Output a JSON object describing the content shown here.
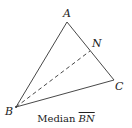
{
  "diagram": {
    "type": "triangle-with-median",
    "vertices": {
      "A": {
        "label": "A",
        "x": 67,
        "y": 22
      },
      "B": {
        "label": "B",
        "x": 16,
        "y": 107
      },
      "C": {
        "label": "C",
        "x": 114,
        "y": 80
      },
      "N": {
        "label": "N",
        "x": 90,
        "y": 51
      }
    },
    "edges": [
      {
        "from": "A",
        "to": "B",
        "style": "solid"
      },
      {
        "from": "A",
        "to": "C",
        "style": "solid"
      },
      {
        "from": "B",
        "to": "C",
        "style": "solid"
      },
      {
        "from": "B",
        "to": "N",
        "style": "dashed"
      }
    ],
    "stroke_color": "#333333"
  },
  "caption": {
    "prefix": "Median ",
    "segment": "BN"
  }
}
